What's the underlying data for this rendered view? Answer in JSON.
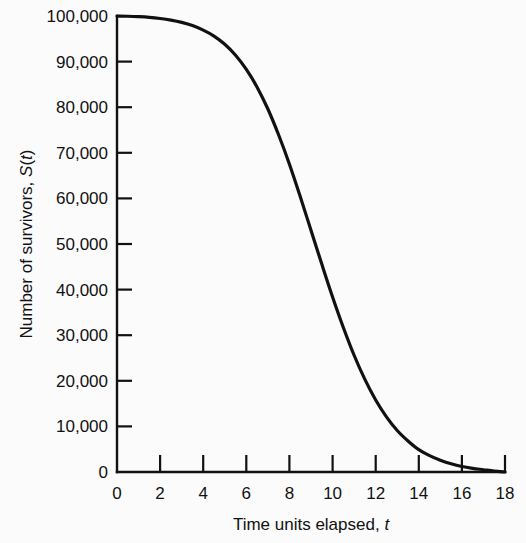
{
  "figure": {
    "background_color": "#fbfbfb",
    "ink_color": "#111111"
  },
  "chart_data": {
    "type": "line",
    "title": "",
    "xlabel_plain": "Time units elapsed, t",
    "ylabel_plain": "Number of survivors, S(t)",
    "xlabel_parts": {
      "text": "Time units elapsed, ",
      "symbol": "t"
    },
    "ylabel_parts": {
      "text": "Number of survivors, ",
      "symbol": "S",
      "paren_open": "(",
      "symbol2": "t",
      "paren_close": ")"
    },
    "xlim": [
      0,
      18
    ],
    "ylim": [
      0,
      100000
    ],
    "grid": false,
    "legend": null,
    "xticks": [
      0,
      2,
      4,
      6,
      8,
      10,
      12,
      14,
      16,
      18
    ],
    "xtick_labels": [
      "0",
      "2",
      "4",
      "6",
      "8",
      "10",
      "12",
      "14",
      "16",
      "18"
    ],
    "yticks": [
      0,
      10000,
      20000,
      30000,
      40000,
      50000,
      60000,
      70000,
      80000,
      90000,
      100000
    ],
    "ytick_labels": [
      "0",
      "10,000",
      "20,000",
      "30,000",
      "40,000",
      "50,000",
      "60,000",
      "70,000",
      "80,000",
      "90,000",
      "100,000"
    ],
    "series": [
      {
        "name": "S(t)",
        "color": "#111111",
        "x": [
          0,
          0.5,
          1,
          1.5,
          2,
          2.5,
          3,
          3.5,
          4,
          4.5,
          5,
          5.5,
          6,
          6.5,
          7,
          7.5,
          8,
          8.5,
          9,
          9.5,
          10,
          10.5,
          11,
          11.5,
          12,
          12.5,
          13,
          13.5,
          14,
          14.5,
          15,
          15.5,
          16,
          16.5,
          17,
          17.5,
          18
        ],
        "values": [
          100000,
          99950,
          99850,
          99700,
          99450,
          99100,
          98600,
          97900,
          96900,
          95600,
          93800,
          91400,
          88300,
          84400,
          79600,
          73900,
          67500,
          60400,
          53000,
          45600,
          38400,
          31700,
          25600,
          20300,
          15800,
          12100,
          9100,
          6800,
          4900,
          3600,
          2600,
          1800,
          1200,
          800,
          500,
          200,
          0
        ]
      }
    ]
  }
}
